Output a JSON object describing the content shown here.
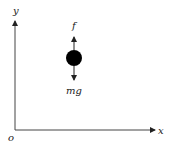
{
  "diagram": {
    "type": "free-body diagram",
    "axes": {
      "origin_label": "o",
      "x_label": "x",
      "y_label": "y"
    },
    "object": {
      "shape": "circle",
      "color": "#000000"
    },
    "forces": [
      {
        "label": "f",
        "direction": "up"
      },
      {
        "label": "mg",
        "direction": "down"
      }
    ]
  }
}
